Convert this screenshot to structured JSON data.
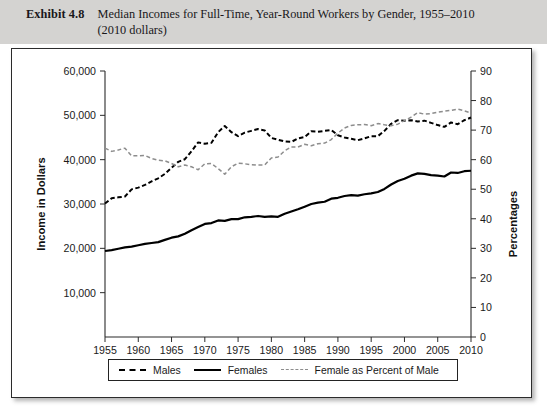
{
  "exhibit": {
    "label": "Exhibit 4.8",
    "title_line1": "Median Incomes for Full-Time, Year-Round Workers by Gender, 1955–2010",
    "title_line2": "(2010 dollars)"
  },
  "chart_data": {
    "type": "line",
    "title": "Median Incomes for Full-Time, Year-Round Workers by Gender, 1955–2010 (2010 dollars)",
    "xlabel": "",
    "ylabel": "Income in Dollars",
    "y2label": "Percentages",
    "xlim": [
      1955,
      2010
    ],
    "ylim": [
      0,
      60000
    ],
    "y2lim": [
      0,
      90
    ],
    "grid": false,
    "legend_position": "bottom",
    "x_ticks": [
      1955,
      1960,
      1965,
      1970,
      1975,
      1980,
      1985,
      1990,
      1995,
      2000,
      2005,
      2010
    ],
    "y_ticks": [
      10000,
      20000,
      30000,
      40000,
      50000,
      60000
    ],
    "y_tick_labels": [
      "10,000",
      "20,000",
      "30,000",
      "40,000",
      "50,000",
      "60,000"
    ],
    "y2_ticks": [
      0,
      10,
      20,
      30,
      40,
      50,
      60,
      70,
      80,
      90
    ],
    "y2_tick_labels": [
      "0",
      "10",
      "20",
      "30",
      "40",
      "50",
      "60",
      "70",
      "80",
      "90"
    ],
    "x": [
      1955,
      1956,
      1957,
      1958,
      1959,
      1960,
      1961,
      1962,
      1963,
      1964,
      1965,
      1966,
      1967,
      1968,
      1969,
      1970,
      1971,
      1972,
      1973,
      1974,
      1975,
      1976,
      1977,
      1978,
      1979,
      1980,
      1981,
      1982,
      1983,
      1984,
      1985,
      1986,
      1987,
      1988,
      1989,
      1990,
      1991,
      1992,
      1993,
      1994,
      1995,
      1996,
      1997,
      1998,
      1999,
      2000,
      2001,
      2002,
      2003,
      2004,
      2005,
      2006,
      2007,
      2008,
      2009,
      2010
    ],
    "series": [
      {
        "name": "Males",
        "style": "dashed",
        "color": "#000000",
        "axis": "left",
        "units": "2010 dollars",
        "values": [
          30100,
          31300,
          31500,
          31700,
          33300,
          33700,
          34300,
          35100,
          35800,
          36800,
          38200,
          39500,
          40100,
          41900,
          43900,
          43600,
          43800,
          46200,
          47600,
          46200,
          45300,
          46100,
          46500,
          46900,
          46600,
          44900,
          44500,
          44100,
          44000,
          44800,
          45100,
          46400,
          46300,
          46500,
          46700,
          45500,
          45000,
          44700,
          44400,
          44800,
          45300,
          45300,
          46500,
          48100,
          48900,
          48800,
          48900,
          48600,
          48800,
          48300,
          47800,
          47400,
          48400,
          48000,
          48900,
          49500
        ]
      },
      {
        "name": "Females",
        "style": "solid",
        "color": "#000000",
        "axis": "left",
        "units": "2010 dollars",
        "values": [
          19400,
          19600,
          19900,
          20200,
          20400,
          20700,
          21000,
          21200,
          21400,
          21900,
          22400,
          22700,
          23300,
          24100,
          24800,
          25500,
          25700,
          26300,
          26200,
          26600,
          26600,
          27000,
          27100,
          27300,
          27100,
          27200,
          27100,
          27800,
          28300,
          28800,
          29400,
          30000,
          30300,
          30500,
          31200,
          31400,
          31800,
          32000,
          31900,
          32200,
          32400,
          32700,
          33400,
          34400,
          35200,
          35700,
          36400,
          36900,
          36800,
          36500,
          36400,
          36200,
          37100,
          37000,
          37400,
          37500
        ]
      },
      {
        "name": "Female as Percent of Male",
        "style": "dashed-light",
        "color": "#8d8d8d",
        "axis": "right",
        "units": "percent",
        "values": [
          63.9,
          62.8,
          63.3,
          63.9,
          61.3,
          61.3,
          61.4,
          60.4,
          59.8,
          59.6,
          58.7,
          57.6,
          58.2,
          57.6,
          56.6,
          58.6,
          58.7,
          57.0,
          55.1,
          57.6,
          58.8,
          58.6,
          58.3,
          58.2,
          58.2,
          60.6,
          60.9,
          63.0,
          64.3,
          64.3,
          65.2,
          64.7,
          65.4,
          65.6,
          66.8,
          69.0,
          70.7,
          71.6,
          71.8,
          71.9,
          71.5,
          72.2,
          71.8,
          71.5,
          72.0,
          73.2,
          74.4,
          75.9,
          75.4,
          75.6,
          76.1,
          76.4,
          76.7,
          77.1,
          76.5,
          75.8
        ]
      }
    ],
    "legend": [
      {
        "label": "Males",
        "style": "dashed",
        "color": "#000000"
      },
      {
        "label": "Females",
        "style": "solid",
        "color": "#000000"
      },
      {
        "label": "Female as Percent of Male",
        "style": "dashed-light",
        "color": "#8d8d8d"
      }
    ]
  },
  "colors": {
    "header_band": "#d4d3d1",
    "panel_background": "#ffffff",
    "panel_border": "#2b2b2b",
    "males_line": "#000000",
    "females_line": "#000000",
    "ratio_line": "#8d8d8d"
  }
}
